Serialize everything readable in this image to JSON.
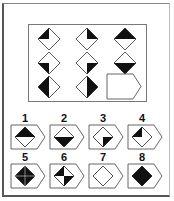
{
  "puzzle": {
    "type": "3x3 matrix reasoning",
    "shape": "diamond",
    "colors": {
      "fill": "#111111",
      "empty": "#ffffff",
      "stroke": "#333333"
    },
    "matrix": [
      [
        {
          "id": "r1c1",
          "fill": "top-left-quarter"
        },
        {
          "id": "r1c2",
          "fill": "top-right-quarter"
        },
        {
          "id": "r1c3",
          "fill": "top-half"
        }
      ],
      [
        {
          "id": "r2c1",
          "fill": "bottom-left-quarter"
        },
        {
          "id": "r2c2",
          "fill": "bottom-right-quarter"
        },
        {
          "id": "r2c3",
          "fill": "bottom-half"
        }
      ],
      [
        {
          "id": "r3c1",
          "fill": "left-half"
        },
        {
          "id": "r3c2",
          "fill": "right-half"
        },
        {
          "id": "r3c3",
          "fill": "missing"
        }
      ]
    ],
    "options": [
      {
        "label": "1",
        "fill": "top-half"
      },
      {
        "label": "2",
        "fill": "bottom-half"
      },
      {
        "label": "3",
        "fill": "bottom-right-quarter"
      },
      {
        "label": "4",
        "fill": "top-left-quarter"
      },
      {
        "label": "5",
        "fill": "full-black-with-cross"
      },
      {
        "label": "6",
        "fill": "top-left-and-bottom-right-quarters"
      },
      {
        "label": "7",
        "fill": "empty"
      },
      {
        "label": "8",
        "fill": "full-black"
      }
    ]
  }
}
